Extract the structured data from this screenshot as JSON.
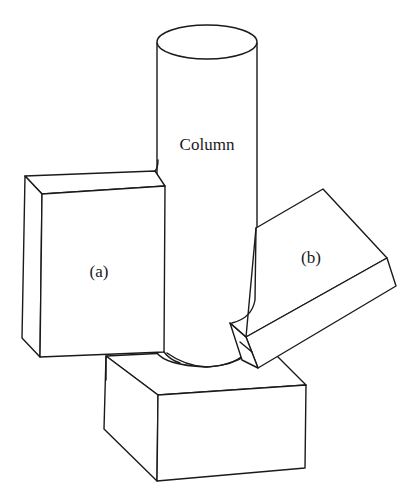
{
  "figure": {
    "labels": {
      "column": "Column",
      "block_a": "(a)",
      "block_b": "(b)"
    },
    "colors": {
      "stroke": "#1a1a1a",
      "background": "#ffffff"
    }
  }
}
